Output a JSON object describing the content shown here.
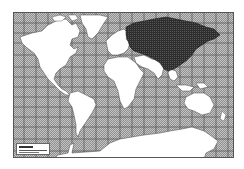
{
  "map": {
    "type": "world-map",
    "projection": "Mercator",
    "colors": {
      "ocean": "#b8b8b8",
      "ocean_hatch": "#9a9a9a",
      "grid": "#555555",
      "land": "#ffffff",
      "highlight": "#3a3a3a",
      "border": "#555555"
    },
    "highlighted_regions": [
      "Soviet Union",
      "Mongolia",
      "China"
    ],
    "unhighlighted_regions": [
      "North America",
      "Greenland",
      "South America",
      "Europe",
      "Africa",
      "Middle East",
      "India",
      "Southeast Asia",
      "Australia",
      "Antarctica"
    ],
    "grid": {
      "spacing_px": 10
    },
    "legend": {
      "label": ""
    }
  }
}
